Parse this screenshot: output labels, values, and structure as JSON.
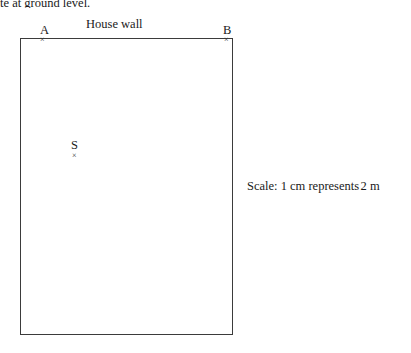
{
  "top_text": {
    "clipped_line": "te at ground level."
  },
  "diagram": {
    "wall_label": "House wall",
    "point_a_label": "A",
    "point_b_label": "B",
    "point_s_label": "S",
    "mark_glyph": "×",
    "stroke_color": "#3b3b3b"
  },
  "scale": {
    "prefix": "Scale: 1 cm represents",
    "value": "2 m"
  }
}
